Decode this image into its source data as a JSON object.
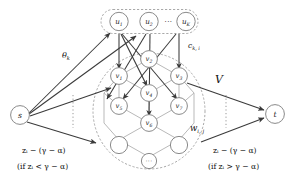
{
  "figure": {
    "colors": {
      "arrow": "#3a3a3a",
      "lattice_edge": "#b9b9b9",
      "node_stroke": "#7d7d7d",
      "boundary": "#9a9a9a",
      "background": "#ffffff"
    }
  },
  "terminals": {
    "source": {
      "label": "s"
    },
    "sink": {
      "label": "t"
    }
  },
  "top_group": {
    "name": "u-layer",
    "nodes": [
      {
        "id": "u1",
        "base": "u",
        "sub": "1"
      },
      {
        "id": "u2",
        "base": "u",
        "sub": "2"
      },
      {
        "id": "uK",
        "base": "u",
        "sub": "K"
      }
    ],
    "ellipsis": "···"
  },
  "lattice_group": {
    "name": "V",
    "set_label": "V",
    "nodes": [
      {
        "id": "v1",
        "base": "v",
        "sub": "1"
      },
      {
        "id": "v2",
        "base": "v",
        "sub": "2"
      },
      {
        "id": "v3",
        "base": "v",
        "sub": "3"
      },
      {
        "id": "v4",
        "base": "v",
        "sub": "4"
      },
      {
        "id": "v5",
        "base": "v",
        "sub": "5"
      },
      {
        "id": "v6",
        "base": "v",
        "sub": "6"
      },
      {
        "id": "v7",
        "base": "v",
        "sub": "7"
      },
      {
        "id": "vBL",
        "base": "",
        "sub": ""
      },
      {
        "id": "vBR",
        "base": "",
        "sub": ""
      }
    ],
    "ellipsis_node": "···"
  },
  "labels": {
    "theta_k": "θ",
    "theta_k_sub": "k",
    "c_ki": "c",
    "c_ki_sub": "k, i",
    "w_ij": "w",
    "w_ij_sub": "i, j",
    "set_V": "V",
    "left_capacity": "zᵢ − (γ − α)",
    "left_condition": "(if zᵢ < γ − α)",
    "right_capacity": "zᵢ − (γ − α)",
    "right_condition": "(if zᵢ > γ − α)"
  }
}
